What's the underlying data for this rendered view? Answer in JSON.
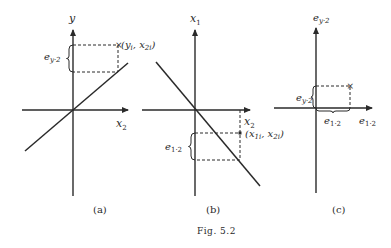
{
  "figure": {
    "caption": "Fig. 5.2",
    "panels": [
      {
        "id": "a",
        "label": "(a)",
        "vertical_axis": "y",
        "horizontal_axis": "x",
        "horizontal_axis_sub": "2",
        "point_label": "(y",
        "point_label_sub1": "i",
        "point_label_mid": ", x",
        "point_label_sub2": "2i",
        "point_label_end": ")",
        "residual_label": "e",
        "residual_label_sub": "y·2",
        "line_slope": "positive"
      },
      {
        "id": "b",
        "label": "(b)",
        "vertical_axis": "x",
        "vertical_axis_sub": "1",
        "horizontal_axis": "x",
        "horizontal_axis_sub": "2",
        "point_label": "(x",
        "point_label_sub1": "1i",
        "point_label_mid": ", x",
        "point_label_sub2": "2i",
        "point_label_end": ")",
        "residual_label": "e",
        "residual_label_sub": "1·2",
        "line_slope": "negative"
      },
      {
        "id": "c",
        "label": "(c)",
        "vertical_axis": "e",
        "vertical_axis_sub": "y·2",
        "horizontal_axis": "e",
        "horizontal_axis_sub": "1·2",
        "vertical_residual_label": "e",
        "vertical_residual_label_sub": "y·2",
        "horizontal_residual_label": "e",
        "horizontal_residual_label_sub": "1·2",
        "point_marker": "×"
      }
    ]
  }
}
